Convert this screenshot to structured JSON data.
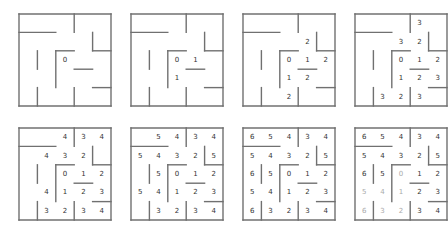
{
  "figure": {
    "title": ""
  },
  "maze": {
    "size": 5,
    "walls": [
      {
        "x1": 0,
        "y1": 1,
        "x2": 2,
        "y2": 1
      },
      {
        "x1": 3,
        "y1": 0,
        "x2": 3,
        "y2": 1
      },
      {
        "x1": 4,
        "y1": 1,
        "x2": 4,
        "y2": 2
      },
      {
        "x1": 4,
        "y1": 2,
        "x2": 5,
        "y2": 2
      },
      {
        "x1": 2,
        "y1": 2,
        "x2": 3,
        "y2": 2
      },
      {
        "x1": 2,
        "y1": 2,
        "x2": 2,
        "y2": 4
      },
      {
        "x1": 1,
        "y1": 2,
        "x2": 1,
        "y2": 3
      },
      {
        "x1": 3,
        "y1": 3,
        "x2": 4,
        "y2": 3
      },
      {
        "x1": 4,
        "y1": 4,
        "x2": 5,
        "y2": 4
      },
      {
        "x1": 1,
        "y1": 4,
        "x2": 1,
        "y2": 5
      },
      {
        "x1": 3,
        "y1": 4,
        "x2": 3,
        "y2": 5
      }
    ]
  },
  "panels": [
    {
      "step": 0,
      "cells": [
        [
          "",
          "",
          "",
          "",
          ""
        ],
        [
          "",
          "",
          "",
          "",
          ""
        ],
        [
          "",
          "",
          "0",
          "",
          ""
        ],
        [
          "",
          "",
          "",
          "",
          ""
        ],
        [
          "",
          "",
          "",
          "",
          ""
        ]
      ]
    },
    {
      "step": 1,
      "cells": [
        [
          "",
          "",
          "",
          "",
          ""
        ],
        [
          "",
          "",
          "",
          "",
          ""
        ],
        [
          "",
          "",
          "0",
          "1",
          ""
        ],
        [
          "",
          "",
          "1",
          "",
          ""
        ],
        [
          "",
          "",
          "",
          "",
          ""
        ]
      ]
    },
    {
      "step": 2,
      "cells": [
        [
          "",
          "",
          "",
          "",
          ""
        ],
        [
          "",
          "",
          "",
          "2",
          ""
        ],
        [
          "",
          "",
          "0",
          "1",
          "2"
        ],
        [
          "",
          "",
          "1",
          "2",
          ""
        ],
        [
          "",
          "",
          "2",
          "",
          ""
        ]
      ]
    },
    {
      "step": 3,
      "cells": [
        [
          "",
          "",
          "",
          "3",
          ""
        ],
        [
          "",
          "",
          "3",
          "2",
          ""
        ],
        [
          "",
          "",
          "0",
          "1",
          "2"
        ],
        [
          "",
          "",
          "1",
          "2",
          "3"
        ],
        [
          "",
          "3",
          "2",
          "3",
          ""
        ]
      ]
    },
    {
      "step": 4,
      "cells": [
        [
          "",
          "",
          "4",
          "3",
          "4"
        ],
        [
          "",
          "4",
          "3",
          "2",
          ""
        ],
        [
          "",
          "",
          "0",
          "1",
          "2"
        ],
        [
          "",
          "4",
          "1",
          "2",
          "3"
        ],
        [
          "",
          "3",
          "2",
          "3",
          "4"
        ]
      ]
    },
    {
      "step": 5,
      "cells": [
        [
          "",
          "5",
          "4",
          "3",
          "4"
        ],
        [
          "5",
          "4",
          "3",
          "2",
          "5"
        ],
        [
          "",
          "5",
          "0",
          "1",
          "2"
        ],
        [
          "5",
          "4",
          "1",
          "2",
          "3"
        ],
        [
          "",
          "3",
          "2",
          "3",
          "4"
        ]
      ]
    },
    {
      "step": 6,
      "cells": [
        [
          "6",
          "5",
          "4",
          "3",
          "4"
        ],
        [
          "5",
          "4",
          "3",
          "2",
          "5"
        ],
        [
          "6",
          "5",
          "0",
          "1",
          "2"
        ],
        [
          "5",
          "4",
          "1",
          "2",
          "3"
        ],
        [
          "6",
          "3",
          "2",
          "3",
          "4"
        ]
      ]
    },
    {
      "step": 7,
      "cells": [
        [
          "6",
          "5",
          "4",
          "3",
          "4"
        ],
        [
          "5",
          "4",
          "3",
          "2",
          "5"
        ],
        [
          "6",
          "5",
          "0",
          "1",
          "2"
        ],
        [
          "5",
          "4",
          "1",
          "2",
          "3"
        ],
        [
          "6",
          "3",
          "2",
          "3",
          "4"
        ]
      ],
      "faint": [
        [
          4,
          0
        ],
        [
          4,
          1
        ],
        [
          4,
          2
        ],
        [
          3,
          0
        ],
        [
          3,
          1
        ],
        [
          2,
          2
        ],
        [
          3,
          2
        ]
      ]
    }
  ],
  "layout": {
    "origins": [
      [
        19,
        14
      ],
      [
        131,
        14
      ],
      [
        243,
        14
      ],
      [
        355,
        14
      ],
      [
        19,
        128
      ],
      [
        131,
        128
      ],
      [
        243,
        128
      ],
      [
        355,
        128
      ]
    ],
    "cell": 18.4
  },
  "colors": {
    "wall": "#707070",
    "text": "#333333",
    "faint": "#aaaaaa"
  }
}
